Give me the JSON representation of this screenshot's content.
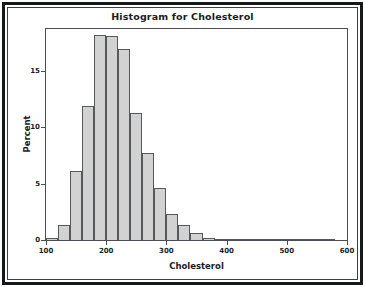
{
  "chart_data": {
    "type": "bar",
    "title": "Histogram for Cholesterol",
    "xlabel": "Cholesterol",
    "ylabel": "Percent",
    "grid": false,
    "legend": null,
    "xlim": [
      100,
      600
    ],
    "ylim": [
      0,
      18.7
    ],
    "bin_width": 20,
    "x_ticks": [
      100,
      200,
      300,
      400,
      500,
      600
    ],
    "x_tick_labels": [
      "100",
      "200",
      "300",
      "400",
      "500",
      "600"
    ],
    "y_ticks": [
      0,
      5,
      10,
      15
    ],
    "y_tick_labels": [
      "0",
      "5",
      "10",
      "15"
    ],
    "bin_starts": [
      100,
      120,
      140,
      160,
      180,
      200,
      220,
      240,
      260,
      280,
      300,
      320,
      340,
      360,
      380,
      400,
      420,
      440,
      460,
      480,
      500,
      520,
      540,
      560
    ],
    "bin_centers": [
      110,
      130,
      150,
      170,
      190,
      210,
      230,
      250,
      270,
      290,
      310,
      330,
      350,
      370,
      390,
      410,
      430,
      450,
      470,
      490,
      510,
      530,
      550,
      570
    ],
    "categories": [
      "100-120",
      "120-140",
      "140-160",
      "160-180",
      "180-200",
      "200-220",
      "220-240",
      "240-260",
      "260-280",
      "280-300",
      "300-320",
      "320-340",
      "340-360",
      "360-380",
      "380-400",
      "400-420",
      "420-440",
      "440-460",
      "460-480",
      "480-500",
      "500-520",
      "520-540",
      "540-560",
      "560-580"
    ],
    "values": [
      0.2,
      1.3,
      6.1,
      11.9,
      18.2,
      18.1,
      16.9,
      11.3,
      7.7,
      4.6,
      2.3,
      1.3,
      0.6,
      0.2,
      0.1,
      0.05,
      0.05,
      0.0,
      0.0,
      0.05,
      0.05,
      0.0,
      0.0,
      0.1
    ],
    "colors": {
      "bar_fill": "#d2d2d2",
      "bar_edge": "#56595c",
      "axis": "#4a4e52",
      "text": "#1a1c1e",
      "background": "#ffffff",
      "outer_frame": "#16181a"
    }
  }
}
